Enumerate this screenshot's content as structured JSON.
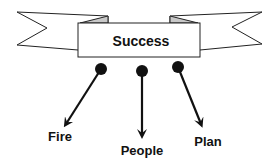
{
  "banner": {
    "title": "Success",
    "fill": "#ffffff",
    "fold_fill": "#c8c8c8",
    "stroke": "#222222"
  },
  "branches": [
    {
      "label": "Fire"
    },
    {
      "label": "People"
    },
    {
      "label": "Plan"
    }
  ],
  "colors": {
    "ink": "#111111",
    "background": "#ffffff"
  }
}
